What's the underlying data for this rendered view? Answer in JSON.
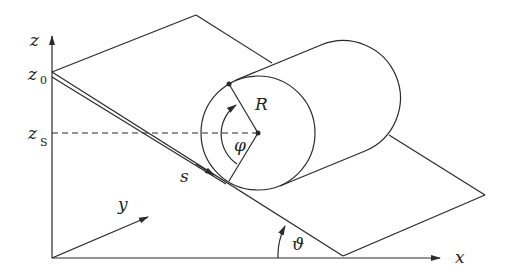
{
  "diagram": {
    "labels": {
      "z_axis": "z",
      "x_axis": "x",
      "y_axis": "y",
      "z0_main": "z",
      "z0_sub": "0",
      "zs_main": "z",
      "zs_sub": "S",
      "s": "s",
      "R": "R",
      "phi": "φ",
      "theta": "ϑ"
    },
    "colors": {
      "line": "#2a2a2a",
      "background": "#ffffff"
    }
  }
}
